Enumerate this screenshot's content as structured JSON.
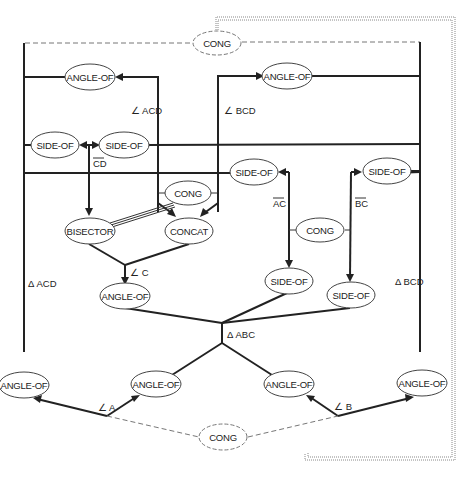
{
  "diagram": {
    "nodes": {
      "cong_top": "CONG",
      "angle_of_acd": "ANGLE-OF",
      "angle_of_bcd": "ANGLE-OF",
      "side_of_left": "SIDE-OF",
      "side_of_mid": "SIDE-OF",
      "side_of_ac_top": "SIDE-OF",
      "side_of_bc_top": "SIDE-OF",
      "cong_mid": "CONG",
      "bisector": "BISECTOR",
      "concat": "CONCAT",
      "cong_sides": "CONG",
      "angle_of_c": "ANGLE-OF",
      "side_of_ac_bottom": "SIDE-OF",
      "side_of_bc_bottom": "SIDE-OF",
      "angle_of_far_left": "ANGLE-OF",
      "angle_of_a": "ANGLE-OF",
      "angle_of_b": "ANGLE-OF",
      "angle_of_far_right": "ANGLE-OF",
      "cong_bottom": "CONG"
    },
    "edge_labels": {
      "angle_acd": "∠ ACD",
      "angle_bcd": "∠ BCD",
      "segment_cd": "CD",
      "segment_ac": "AC",
      "segment_bc": "BC",
      "angle_c": "∠ C",
      "triangle_acd": "Δ ACD",
      "triangle_bcd": "Δ BCD",
      "triangle_abc": "Δ ABC",
      "angle_a": "∠ A",
      "angle_b": "∠ B"
    }
  }
}
